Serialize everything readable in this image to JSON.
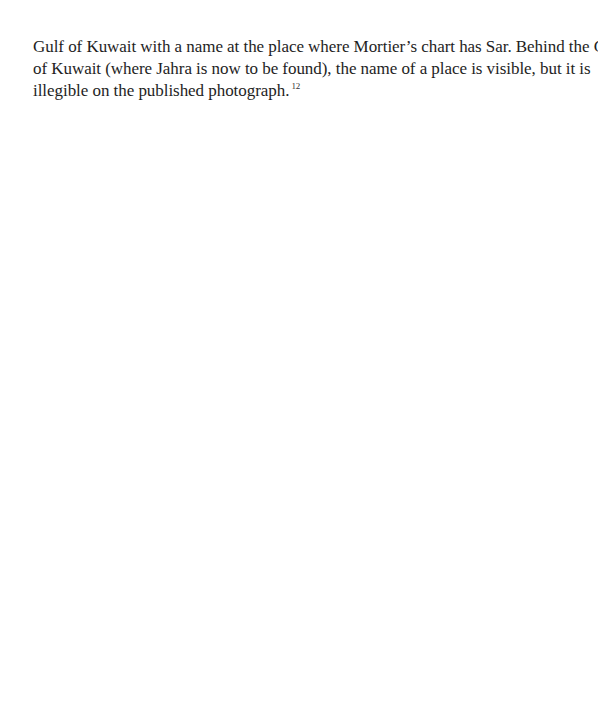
{
  "document": {
    "paragraph": {
      "lines": [
        "Gulf of Kuwait with a name at the place where Mortier’s chart has Sar. Behind the Gulf",
        "of Kuwait (where Jahra is now to be found), the name of a place is visible, but it is",
        "illegible on the published photograph."
      ],
      "footnote_ref": "12"
    }
  }
}
